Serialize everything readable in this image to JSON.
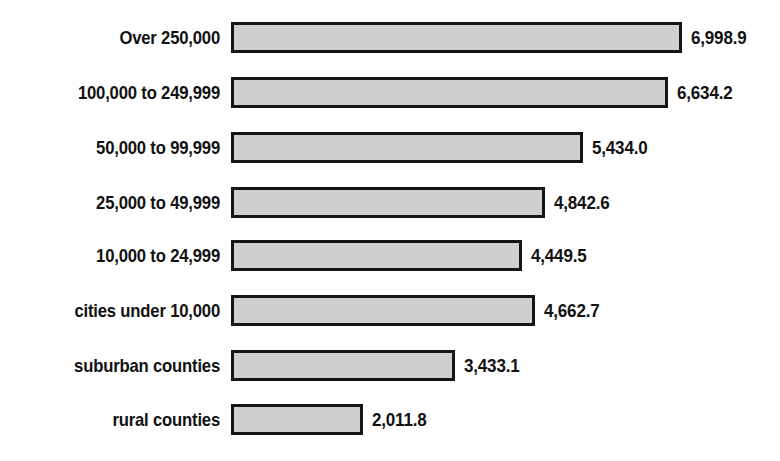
{
  "chart_data": {
    "type": "bar",
    "orientation": "horizontal",
    "title": "",
    "subtitle": "",
    "xlabel": "",
    "ylabel": "",
    "grid": false,
    "legend": false,
    "legend_position": "none",
    "axis_visible": false,
    "xlim": [
      0,
      7400
    ],
    "categories": [
      "Over 250,000",
      "100,000 to 249,999",
      "50,000 to 99,999",
      "25,000 to 49,999",
      "10,000 to 24,999",
      "cities under 10,000",
      "suburban counties",
      "rural counties"
    ],
    "values": [
      6998.9,
      6634.2,
      5434.0,
      4842.6,
      4449.5,
      4662.7,
      3433.1,
      2011.8
    ],
    "value_labels": [
      "6,998.9",
      "6,634.2",
      "5,434.0",
      "4,842.6",
      "4,449.5",
      "4,662.7",
      "3,433.1",
      "2,011.8"
    ],
    "bar_fill_color": "#cfcfcf",
    "bar_border_color": "#151515",
    "text_color": "#111111",
    "background_color": "#ffffff"
  },
  "layout": {
    "bar_left_px": 231,
    "bar_height_px": 31,
    "row_tops_px": [
      22,
      77,
      132,
      187,
      240,
      295,
      350,
      404
    ],
    "bar_widths_px": [
      451,
      437,
      352,
      314,
      291,
      304,
      224,
      132
    ],
    "value_gap_px": 9
  }
}
